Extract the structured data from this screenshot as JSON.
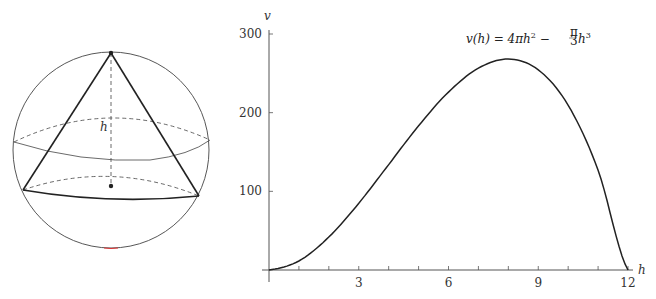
{
  "figure": {
    "left_panel": {
      "description": "Cone inscribed in sphere",
      "height_label": "h"
    }
  },
  "chart_data": {
    "type": "line",
    "title": "",
    "annotation": "v(h) = 4πh² − (π/3)h³",
    "formula_parts": {
      "lhs": "v(h) = 4πh",
      "exp1": "2",
      "mid": " − ",
      "frac_num": "π",
      "frac_den": "3",
      "var": "h",
      "exp2": "3"
    },
    "xlabel": "h",
    "ylabel": "v",
    "xlim": [
      0,
      12
    ],
    "ylim": [
      0,
      300
    ],
    "x_ticks": [
      3,
      6,
      9,
      12
    ],
    "x_minor_step": 1,
    "y_ticks": [
      100,
      200,
      300
    ],
    "grid": false,
    "series": [
      {
        "name": "v(h)",
        "x": [
          0,
          1,
          2,
          3,
          4,
          5,
          6,
          7,
          8,
          9,
          10,
          11,
          12
        ],
        "values": [
          0,
          11.5,
          41.9,
          84.8,
          134.0,
          183.3,
          226.2,
          256.6,
          268.1,
          254.5,
          209.4,
          126.7,
          0
        ]
      }
    ],
    "colors": {
      "line": "#222222",
      "axis": "#444444"
    }
  }
}
